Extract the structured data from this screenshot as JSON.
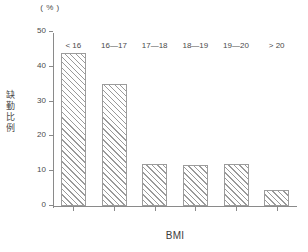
{
  "chart_data": {
    "type": "bar",
    "title": "",
    "subtitle": "",
    "xlabel": "BMI",
    "ylabel": "缺勤比例",
    "yunit": "( % )",
    "categories": [
      "< 16",
      "16—17",
      "17—18",
      "18—19",
      "19—20",
      "> 20"
    ],
    "values": [
      44,
      35,
      12,
      11.8,
      12,
      4.5
    ],
    "ylim": [
      0,
      50
    ],
    "yticks": [
      0,
      10,
      20,
      30,
      40,
      50
    ],
    "ytick_labels": [
      "0",
      "10",
      "20",
      "30",
      "40",
      "50"
    ],
    "grid": false,
    "legend": null,
    "series": [
      {
        "name": "缺勤比例",
        "values": [
          44,
          35,
          12,
          11.8,
          12,
          4.5
        ]
      }
    ],
    "bar_style": {
      "fill": "#ffffff",
      "hatch": "diagonal-lines",
      "edge_color": "#9c9c9c"
    },
    "colors": {
      "axis": "#8a8a8a",
      "text": "#4a4a4a",
      "background": "#ffffff"
    }
  },
  "axis": {
    "y_title_chars": [
      "缺",
      "勤",
      "比",
      "例"
    ]
  }
}
